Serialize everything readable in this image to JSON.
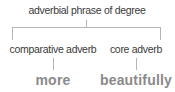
{
  "diagram": {
    "type": "syntax-tree",
    "root": {
      "label": "adverbial phrase of degree"
    },
    "children": [
      {
        "label": "comparative adverb",
        "word": "more"
      },
      {
        "label": "core adverb",
        "word": "beautifully"
      }
    ],
    "colors": {
      "node_text": "#3a3a3a",
      "leaf_text": "#8a8a8a",
      "lines": "#b5b5b5"
    }
  }
}
